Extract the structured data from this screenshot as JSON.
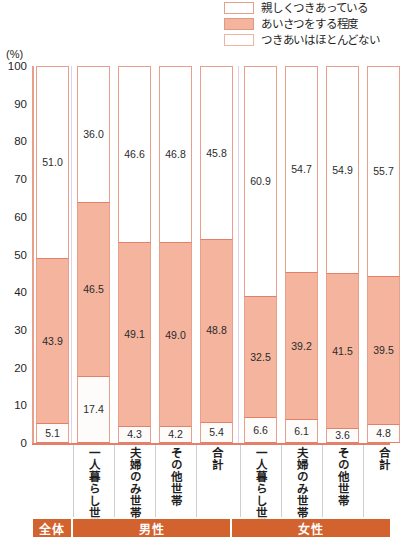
{
  "legend": {
    "items": [
      {
        "label": "親しくつきあっている",
        "swatch": "white-outline",
        "color": "#ffffff"
      },
      {
        "label": "あいさつをする程度",
        "swatch": "pink-filled",
        "color": "#f4b49e"
      },
      {
        "label": "つきあいはほとんどない",
        "swatch": "white-outline",
        "color": "#ffffff"
      }
    ]
  },
  "axis": {
    "unit": "(%)",
    "ticks": [
      "100",
      "90",
      "80",
      "70",
      "60",
      "50",
      "40",
      "30",
      "20",
      "10",
      "0"
    ]
  },
  "groups": [
    {
      "name": "全体"
    },
    {
      "name": "男性"
    },
    {
      "name": "女性"
    }
  ],
  "chart_data": {
    "type": "bar",
    "title": "",
    "xlabel": "",
    "ylabel": "(%)",
    "ylim": [
      0,
      100
    ],
    "grid": false,
    "legend_position": "top-right",
    "stacked": true,
    "categories": [
      "全体",
      "一人暮らし世帯",
      "夫婦のみ世帯",
      "その他世帯",
      "合計",
      "一人暮らし世帯",
      "夫婦のみ世帯",
      "その他世帯",
      "合計"
    ],
    "groups": [
      "全体",
      "男性",
      "男性",
      "男性",
      "男性",
      "女性",
      "女性",
      "女性",
      "女性"
    ],
    "series": [
      {
        "name": "親しくつきあっている",
        "values": [
          51.0,
          36.0,
          46.6,
          46.8,
          45.8,
          60.9,
          54.7,
          54.9,
          55.7
        ]
      },
      {
        "name": "あいさつをする程度",
        "values": [
          43.9,
          46.5,
          49.1,
          49.0,
          48.8,
          32.5,
          39.2,
          41.5,
          39.5
        ]
      },
      {
        "name": "つきあいはほとんどない",
        "values": [
          5.1,
          17.4,
          4.3,
          4.2,
          5.4,
          6.6,
          6.1,
          3.6,
          4.8
        ]
      }
    ]
  },
  "colors": {
    "pink_fill": "#f4b49e",
    "pink_border": "#e8a08c",
    "strong_border": "#e4806a",
    "group_bar": "#d2622e"
  }
}
